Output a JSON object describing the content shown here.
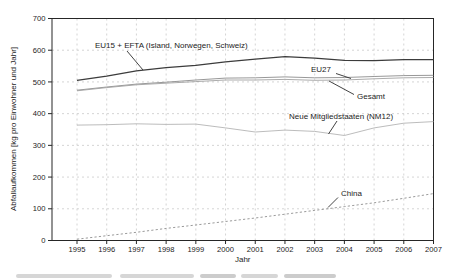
{
  "chart_data": {
    "type": "line",
    "title": "",
    "xlabel": "Jahr",
    "ylabel": "Abfallaufkommen [kg pro Einwohner und Jahr]",
    "x": [
      1995,
      1996,
      1997,
      1998,
      1999,
      2000,
      2001,
      2002,
      2003,
      2004,
      2005,
      2006,
      2007
    ],
    "ylim": [
      0,
      700
    ],
    "yticks": [
      0,
      100,
      200,
      300,
      400,
      500,
      600,
      700
    ],
    "grid": true,
    "legend_position": "inline-annotations",
    "series": [
      {
        "id": "eu15-efta",
        "name": "EU15 + EFTA (Island, Norwegen, Schweiz)",
        "values": [
          505,
          518,
          535,
          545,
          552,
          563,
          572,
          580,
          575,
          568,
          567,
          570,
          570
        ],
        "style": "solid",
        "color": "#3c3c3c",
        "width": 1.3
      },
      {
        "id": "eu27",
        "name": "EU27",
        "values": [
          474,
          484,
          493,
          499,
          506,
          512,
          513,
          516,
          513,
          514,
          517,
          520,
          521
        ],
        "style": "solid",
        "color": "#8c8c8c",
        "width": 0.9
      },
      {
        "id": "gesamt",
        "name": "Gesamt",
        "values": [
          472,
          482,
          491,
          496,
          501,
          506,
          506,
          508,
          505,
          506,
          510,
          513,
          514
        ],
        "style": "solid",
        "color": "#a2a2a2",
        "width": 0.9
      },
      {
        "id": "nm12",
        "name": "Neue Mitgliedstaaten (NM12)",
        "values": [
          364,
          365,
          368,
          366,
          367,
          355,
          342,
          348,
          344,
          331,
          355,
          370,
          375
        ],
        "style": "solid",
        "color": "#b4b4b4",
        "width": 0.9
      },
      {
        "id": "china",
        "name": "China",
        "values": [
          4,
          15,
          26,
          38,
          49,
          60,
          71,
          83,
          95,
          107,
          119,
          133,
          148
        ],
        "style": "dashed",
        "color": "#8e8e8e",
        "width": 0.9
      }
    ]
  }
}
